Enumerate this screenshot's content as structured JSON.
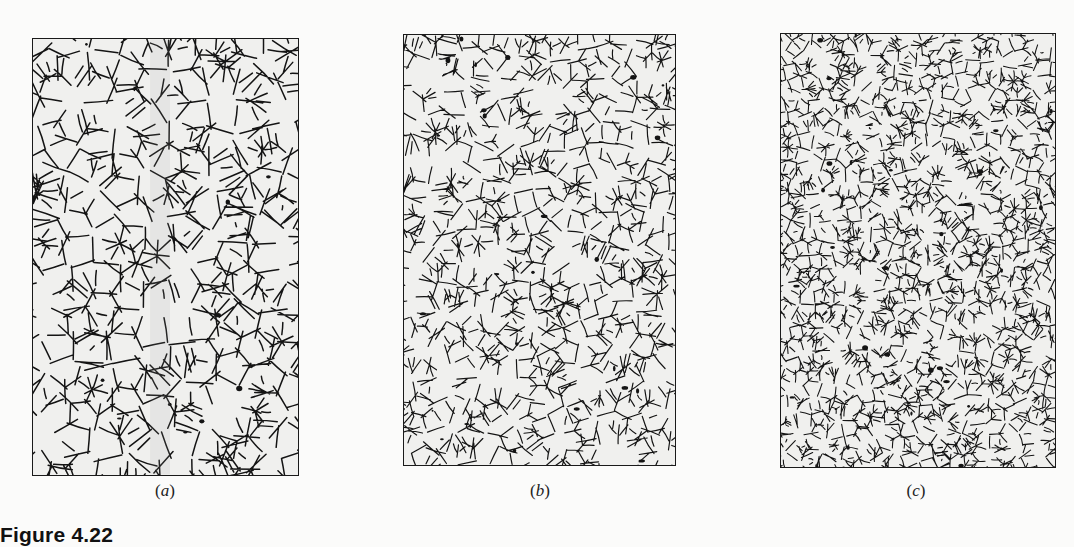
{
  "figure": {
    "label": "Figure 4.22",
    "panels": [
      {
        "id": "a",
        "caption_open": "(",
        "caption_letter": "a",
        "caption_close": ")",
        "grain_size": "coarse",
        "description": "Micrograph of coarse equiaxed grain structure with dark grain boundaries"
      },
      {
        "id": "b",
        "caption_open": "(",
        "caption_letter": "b",
        "caption_close": ")",
        "grain_size": "medium",
        "description": "Micrograph of medium grain structure"
      },
      {
        "id": "c",
        "caption_open": "(",
        "caption_letter": "c",
        "caption_close": ")",
        "grain_size": "fine",
        "description": "Micrograph of fine grain structure"
      }
    ]
  },
  "colors": {
    "page": "#fbfbfa",
    "grain": "#f0f0ee",
    "boundary": "#141414",
    "frame": "#1a1a1a"
  }
}
